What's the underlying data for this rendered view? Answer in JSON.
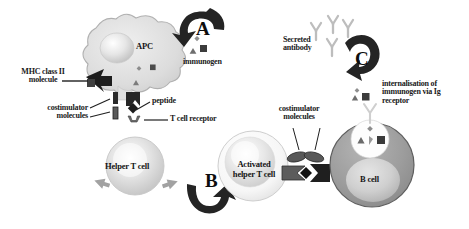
{
  "figure": {
    "background": "#ffffff",
    "width": 469,
    "height": 229
  },
  "steps": [
    {
      "id": "A",
      "label": "A",
      "x": 196,
      "y": 26,
      "meaning": "uptake of immunogen by APC"
    },
    {
      "id": "B",
      "label": "B",
      "x": 205,
      "y": 178,
      "meaning": "helper T cell activation"
    },
    {
      "id": "C",
      "label": "C",
      "x": 355,
      "y": 56,
      "meaning": "antibody secretion by B cell"
    }
  ],
  "cells": [
    {
      "id": "apc",
      "label": "APC",
      "color": "#d7d7d7",
      "label_x": 145,
      "label_y": 47
    },
    {
      "id": "helper-t",
      "label": "Helper T cell",
      "color": "#cfcfcf",
      "label_x": 108,
      "label_y": 170
    },
    {
      "id": "activated-helper-t",
      "label_line1": "Activated",
      "label_line2": "helper T cell",
      "color": "#e8e8e8",
      "label_x": 238,
      "label_y": 168
    },
    {
      "id": "b-cell",
      "label": "B cell",
      "color": "#9e9e9e",
      "label_x": 369,
      "label_y": 180
    }
  ],
  "labels": {
    "mhc_class_ii": "MHC class II\nmolecule",
    "immunogen": "immunogen",
    "peptide": "peptide",
    "costimulator_left": "costimulator\nmolecules",
    "t_cell_receptor": "T cell receptor",
    "secreted_antibody": "Secreted\nantibody",
    "internalisation": "internalisation of\nimmunogen via Ig\nreceptor",
    "costimulator_right": "costimulator\nmolecules"
  },
  "label_positions": {
    "mhc_class_ii": {
      "x": 13,
      "y": 74
    },
    "immunogen": {
      "x": 185,
      "y": 62
    },
    "peptide": {
      "x": 152,
      "y": 101
    },
    "costimulator_left": {
      "x": 41,
      "y": 112
    },
    "t_cell_receptor": {
      "x": 173,
      "y": 128
    },
    "secreted_antibody": {
      "x": 286,
      "y": 38
    },
    "internalisation": {
      "x": 385,
      "y": 84
    },
    "costimulator_right": {
      "x": 273,
      "y": 111
    }
  },
  "symbols": {
    "immunogen_parts": [
      "diamond",
      "triangle",
      "square"
    ],
    "antibody_glyph": "Y",
    "antibody_count": 4,
    "ig_receptor_glyph": "Y",
    "peptide_shape": "diamond",
    "costimulator_shape": "bar"
  },
  "colors": {
    "ink": "#1a1a1a",
    "arrow_dark": "#232323",
    "arrow_gray": "#9a9a9a",
    "apc_fill": "#dcdcdc",
    "apc_stroke": "#b4b4b4",
    "tcell_fill": "#d2d2d2",
    "activated_fill": "#ededed",
    "bcell_fill": "#9d9d9d",
    "bcell_stroke": "#5f5f5f",
    "vesicle_fill": "#fdfdfd",
    "nucleus_light": "#f2f2f2",
    "marker_dark": "#3a3a3a"
  }
}
